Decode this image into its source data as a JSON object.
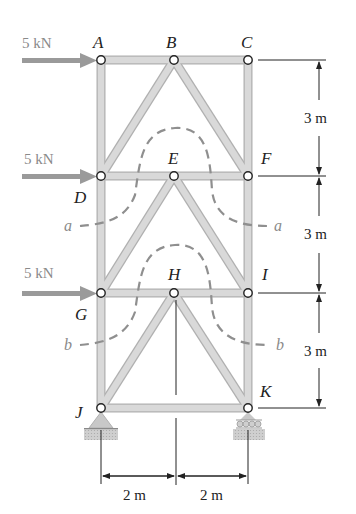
{
  "figure": {
    "type": "plane truss",
    "nodes": {
      "A": {
        "label": "A",
        "x": 101,
        "y": 60
      },
      "B": {
        "label": "B",
        "x": 174,
        "y": 60
      },
      "C": {
        "label": "C",
        "x": 248,
        "y": 60
      },
      "D": {
        "label": "D",
        "x": 101,
        "y": 176
      },
      "E": {
        "label": "E",
        "x": 174,
        "y": 176
      },
      "F": {
        "label": "F",
        "x": 248,
        "y": 176
      },
      "G": {
        "label": "G",
        "x": 101,
        "y": 293
      },
      "H": {
        "label": "H",
        "x": 174,
        "y": 293
      },
      "I": {
        "label": "I",
        "x": 248,
        "y": 293
      },
      "J": {
        "label": "J",
        "x": 101,
        "y": 408
      },
      "K": {
        "label": "K",
        "x": 248,
        "y": 408
      }
    },
    "members": [
      [
        "A",
        "B"
      ],
      [
        "B",
        "C"
      ],
      [
        "A",
        "D"
      ],
      [
        "C",
        "F"
      ],
      [
        "D",
        "B"
      ],
      [
        "B",
        "F"
      ],
      [
        "D",
        "E"
      ],
      [
        "E",
        "F"
      ],
      [
        "D",
        "G"
      ],
      [
        "F",
        "I"
      ],
      [
        "G",
        "E"
      ],
      [
        "E",
        "I"
      ],
      [
        "G",
        "H"
      ],
      [
        "H",
        "I"
      ],
      [
        "G",
        "J"
      ],
      [
        "I",
        "K"
      ],
      [
        "J",
        "H"
      ],
      [
        "H",
        "K"
      ],
      [
        "J",
        "K"
      ]
    ],
    "loads": [
      {
        "node": "A",
        "label": "5 kN",
        "direction": "right"
      },
      {
        "node": "D",
        "label": "5 kN",
        "direction": "right"
      },
      {
        "node": "G",
        "label": "5 kN",
        "direction": "right"
      }
    ],
    "supports": [
      {
        "node": "J",
        "type": "pin"
      },
      {
        "node": "K",
        "type": "roller"
      }
    ],
    "dimensions": {
      "vertical": [
        "3 m",
        "3 m",
        "3 m"
      ],
      "horizontal": [
        "2 m",
        "2 m"
      ]
    },
    "sections": [
      {
        "label_left": "a",
        "label_right": "a"
      },
      {
        "label_left": "b",
        "label_right": "b"
      }
    ],
    "colors": {
      "member_fill": "#d9d9d9",
      "member_edge": "#b0b0b0",
      "load_arrow": "#9a9a9a",
      "section_line": "#8f8f8f",
      "dimension_line": "#222222"
    }
  }
}
